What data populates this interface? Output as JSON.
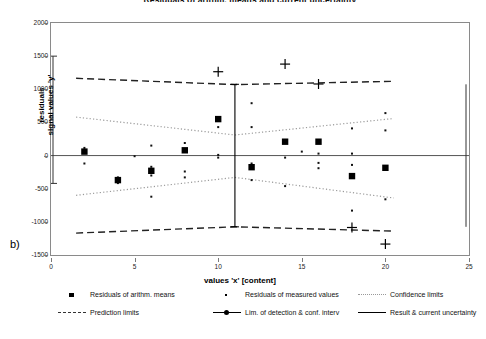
{
  "chart_data": {
    "type": "scatter",
    "title": "Residuals of arithm. means and current uncertainty",
    "xlabel": "values 'x' [content]",
    "ylabel": "residuals\nsignal values 'y'",
    "panel_label": "b)",
    "xlim": [
      0,
      25
    ],
    "ylim": [
      -1500,
      2000
    ],
    "xticks": [
      0,
      5,
      10,
      15,
      20,
      25
    ],
    "yticks": [
      2000,
      1500,
      1000,
      500,
      0,
      -500,
      -1000,
      -1500
    ],
    "grid": false,
    "legend_position": "bottom",
    "series": [
      {
        "name": "Residuals of arithm. means",
        "marker": "square",
        "points": [
          {
            "x": 2,
            "y": 60
          },
          {
            "x": 4,
            "y": -370
          },
          {
            "x": 6,
            "y": -230
          },
          {
            "x": 8,
            "y": 80
          },
          {
            "x": 10,
            "y": 550
          },
          {
            "x": 12,
            "y": -175
          },
          {
            "x": 14,
            "y": 210
          },
          {
            "x": 16,
            "y": 210
          },
          {
            "x": 18,
            "y": -310
          },
          {
            "x": 20,
            "y": -185
          }
        ]
      },
      {
        "name": "Residuals of measured values",
        "marker": "dot",
        "points": [
          {
            "x": 2,
            "y": 115
          },
          {
            "x": 2,
            "y": 40
          },
          {
            "x": 2,
            "y": -120
          },
          {
            "x": 4,
            "y": -330
          },
          {
            "x": 4,
            "y": -415
          },
          {
            "x": 5,
            "y": -10
          },
          {
            "x": 6,
            "y": 150
          },
          {
            "x": 6,
            "y": -170
          },
          {
            "x": 6,
            "y": -300
          },
          {
            "x": 6,
            "y": -620
          },
          {
            "x": 8,
            "y": 190
          },
          {
            "x": 8,
            "y": -240
          },
          {
            "x": 8,
            "y": -330
          },
          {
            "x": 10,
            "y": 10
          },
          {
            "x": 10,
            "y": -30
          },
          {
            "x": 10,
            "y": 560
          },
          {
            "x": 10,
            "y": 430
          },
          {
            "x": 12,
            "y": 430
          },
          {
            "x": 12,
            "y": 790
          },
          {
            "x": 12,
            "y": -120
          },
          {
            "x": 12,
            "y": -370
          },
          {
            "x": 14,
            "y": -30
          },
          {
            "x": 14,
            "y": -460
          },
          {
            "x": 15,
            "y": 60
          },
          {
            "x": 16,
            "y": 30
          },
          {
            "x": 16,
            "y": -110
          },
          {
            "x": 16,
            "y": -190
          },
          {
            "x": 18,
            "y": 30
          },
          {
            "x": 18,
            "y": -140
          },
          {
            "x": 18,
            "y": 410
          },
          {
            "x": 18,
            "y": -830
          },
          {
            "x": 20,
            "y": 640
          },
          {
            "x": 20,
            "y": 380
          },
          {
            "x": 20,
            "y": -660
          }
        ]
      },
      {
        "name": "Confidence limits",
        "style": "dotted",
        "upper": [
          {
            "x": 1.5,
            "y": 580
          },
          {
            "x": 11,
            "y": 310
          },
          {
            "x": 20.5,
            "y": 560
          }
        ],
        "lower": [
          {
            "x": 1.5,
            "y": -600
          },
          {
            "x": 11,
            "y": -330
          },
          {
            "x": 20.5,
            "y": -640
          }
        ]
      },
      {
        "name": "Prediction limits",
        "style": "dashed",
        "upper": [
          {
            "x": 1.5,
            "y": 1165
          },
          {
            "x": 11,
            "y": 1070
          },
          {
            "x": 20.5,
            "y": 1120
          }
        ],
        "lower": [
          {
            "x": 1.5,
            "y": -1170
          },
          {
            "x": 11,
            "y": -1075
          },
          {
            "x": 20.5,
            "y": -1140
          }
        ]
      },
      {
        "name": "Lim. of detection & conf. interv",
        "marker": "plus",
        "points": [
          {
            "x": 10,
            "y": 1265
          },
          {
            "x": 14,
            "y": 1380
          },
          {
            "x": 16,
            "y": 1080
          },
          {
            "x": 18,
            "y": -1085
          },
          {
            "x": 20,
            "y": -1335
          }
        ]
      },
      {
        "name": "Result & current uncertainty",
        "style": "solid-cross",
        "x": 11,
        "y_top": 1075,
        "y_bottom": -1075
      }
    ]
  },
  "legend": {
    "items": [
      {
        "label": "Residuals of arithm. means",
        "symbol": "square"
      },
      {
        "label": "Residuals of measured values",
        "symbol": "dot"
      },
      {
        "label": "Confidence limits",
        "symbol": "dotted-line"
      },
      {
        "label": "Prediction limits",
        "symbol": "dashed-line"
      },
      {
        "label": "Lim. of detection & conf. interv",
        "symbol": "solid-line-marker"
      },
      {
        "label": "Result & current uncertainty",
        "symbol": "solid-line"
      }
    ]
  }
}
